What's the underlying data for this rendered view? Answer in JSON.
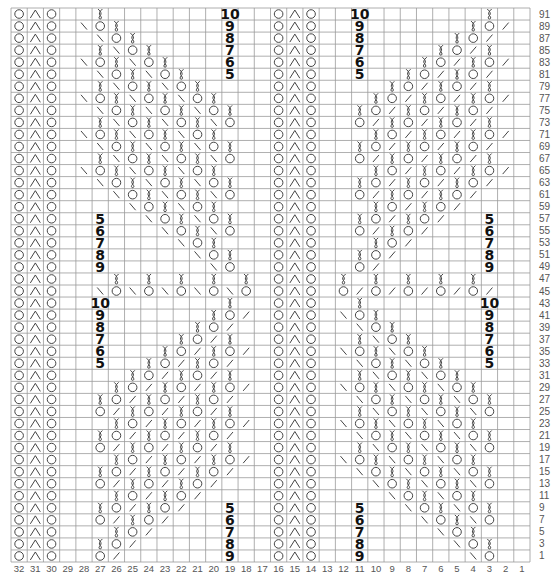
{
  "chart": {
    "type": "knitting-chart",
    "columns": 32,
    "rows_shown": 46,
    "row_numbers": [
      91,
      89,
      87,
      85,
      83,
      81,
      79,
      77,
      75,
      73,
      71,
      69,
      67,
      65,
      63,
      61,
      59,
      57,
      55,
      53,
      51,
      49,
      47,
      45,
      43,
      41,
      39,
      37,
      35,
      33,
      31,
      29,
      27,
      25,
      23,
      21,
      19,
      17,
      15,
      13,
      11,
      9,
      7,
      5,
      3,
      1
    ],
    "column_numbers": [
      32,
      31,
      30,
      29,
      28,
      27,
      26,
      25,
      24,
      23,
      22,
      21,
      20,
      19,
      18,
      17,
      16,
      15,
      14,
      13,
      12,
      11,
      10,
      9,
      8,
      7,
      6,
      5,
      4,
      3,
      2,
      1
    ],
    "legend_codes": {
      ".": "empty",
      "O": "yarn-over",
      "A": "central-double-decrease",
      "T": "twisted-stitch",
      "B": "left-slant-decrease",
      "F": "right-slant-decrease"
    },
    "colors": {
      "grid_line": "#9a9a9a",
      "symbol": "#444444",
      "label": "#111111",
      "axis_text": "#555555"
    },
    "rows": [
      {
        "row": 91,
        "left": "..T..........",
        "right": "..........T..",
        "labels": [
          {
            "col": 19,
            "text": "10"
          },
          {
            "col": 11,
            "text": "10"
          }
        ]
      },
      {
        "row": 89,
        "left": ".BOT.........",
        "right": ".........TOF.",
        "labels": [
          {
            "col": 19,
            "text": "9"
          },
          {
            "col": 11,
            "text": "9"
          }
        ]
      },
      {
        "row": 87,
        "left": "..BOT........",
        "right": "........TOF..",
        "labels": [
          {
            "col": 19,
            "text": "8"
          },
          {
            "col": 11,
            "text": "8"
          }
        ]
      },
      {
        "row": 85,
        "left": "..TBOT.......",
        "right": ".......TOFT..",
        "labels": [
          {
            "col": 19,
            "text": "7"
          },
          {
            "col": 11,
            "text": "7"
          }
        ]
      },
      {
        "row": 83,
        "left": ".BOTBOT......",
        "right": "......TOFTOF.",
        "labels": [
          {
            "col": 19,
            "text": "6"
          },
          {
            "col": 11,
            "text": "6"
          }
        ]
      },
      {
        "row": 81,
        "left": "..BOTBOT.....",
        "right": ".....TOFTOF..",
        "labels": [
          {
            "col": 19,
            "text": "5"
          },
          {
            "col": 11,
            "text": "5"
          }
        ]
      },
      {
        "row": 79,
        "left": "..TBOTBOT....",
        "right": "....TOFTOFT..",
        "labels": []
      },
      {
        "row": 77,
        "left": ".BOTBOTBOT...",
        "right": "...TOFTOFTOF.",
        "labels": []
      },
      {
        "row": 75,
        "left": "..BOTBOTBOT..",
        "right": "..TOFTOFTOF..",
        "labels": []
      },
      {
        "row": 73,
        "left": "..TBOTBOTBO..",
        "right": "..OFTOFTOFT..",
        "labels": []
      },
      {
        "row": 71,
        "left": ".BOTBOTBOT...",
        "right": "...TOFTOFTOF.",
        "labels": []
      },
      {
        "row": 69,
        "left": "..BOTBOTBOT..",
        "right": "..TOFTOFTOF..",
        "labels": []
      },
      {
        "row": 67,
        "left": "..TBOTBOTBO..",
        "right": "..OFTOFTOFT..",
        "labels": []
      },
      {
        "row": 65,
        "left": ".BOTBOTBOT...",
        "right": "...TOFTOFTOF.",
        "labels": []
      },
      {
        "row": 63,
        "left": "..BOTBOTBOT..",
        "right": "..TOFTOFTOF..",
        "labels": []
      },
      {
        "row": 61,
        "left": "...BOTBOTBO..",
        "right": "..OFTOFTOF...",
        "labels": []
      },
      {
        "row": 59,
        "left": "....BOTBOT...",
        "right": "...TOFTOF....",
        "labels": []
      },
      {
        "row": 57,
        "left": ".....BOTBOT..",
        "right": "..TOFTOF.....",
        "labels": [
          {
            "col": 27,
            "text": "5"
          },
          {
            "col": 3,
            "text": "5"
          }
        ]
      },
      {
        "row": 55,
        "left": "......BOTBO..",
        "right": "..OFTOF......",
        "labels": [
          {
            "col": 27,
            "text": "6"
          },
          {
            "col": 3,
            "text": "6"
          }
        ]
      },
      {
        "row": 53,
        "left": ".......BOT...",
        "right": "...TOF.......",
        "labels": [
          {
            "col": 27,
            "text": "7"
          },
          {
            "col": 3,
            "text": "7"
          }
        ]
      },
      {
        "row": 51,
        "left": "........BOT..",
        "right": "..TOF........",
        "labels": [
          {
            "col": 27,
            "text": "8"
          },
          {
            "col": 3,
            "text": "8"
          }
        ]
      },
      {
        "row": 49,
        "left": ".........BO..",
        "right": "..OF.........",
        "labels": [
          {
            "col": 27,
            "text": "9"
          },
          {
            "col": 3,
            "text": "9"
          }
        ]
      },
      {
        "row": 47,
        "left": "...T.T.T.T.T.",
        "right": ".T.T.T.T.T...",
        "labels": []
      },
      {
        "row": 45,
        "left": "..BOBOBOBOBO.",
        "right": ".OFOFOFOFOF..",
        "labels": []
      },
      {
        "row": 43,
        "left": "..........T..",
        "right": "..T..........",
        "labels": [
          {
            "col": 27,
            "text": "10"
          },
          {
            "col": 3,
            "text": "10"
          }
        ]
      },
      {
        "row": 41,
        "left": ".........TOF.",
        "right": ".BOT.........",
        "labels": [
          {
            "col": 27,
            "text": "9"
          },
          {
            "col": 3,
            "text": "9"
          }
        ]
      },
      {
        "row": 39,
        "left": "........TOF..",
        "right": "..BOT........",
        "labels": [
          {
            "col": 27,
            "text": "8"
          },
          {
            "col": 3,
            "text": "8"
          }
        ]
      },
      {
        "row": 37,
        "left": ".......TOFT..",
        "right": "..TBOT.......",
        "labels": [
          {
            "col": 27,
            "text": "7"
          },
          {
            "col": 3,
            "text": "7"
          }
        ]
      },
      {
        "row": 35,
        "left": "......TOFTOF.",
        "right": ".BOTBOT......",
        "labels": [
          {
            "col": 27,
            "text": "6"
          },
          {
            "col": 3,
            "text": "6"
          }
        ]
      },
      {
        "row": 33,
        "left": ".....TOFTOF..",
        "right": "..BOTBOT.....",
        "labels": [
          {
            "col": 27,
            "text": "5"
          },
          {
            "col": 3,
            "text": "5"
          }
        ]
      },
      {
        "row": 31,
        "left": "....TOFTOFT..",
        "right": "..TBOTBOT....",
        "labels": []
      },
      {
        "row": 29,
        "left": "...TOFTOFTOF.",
        "right": ".BOTBOTBOT...",
        "labels": []
      },
      {
        "row": 27,
        "left": "..TOFTOFTOF..",
        "right": "..BOTBOTBOT..",
        "labels": []
      },
      {
        "row": 25,
        "left": "..OFTOFTOFT..",
        "right": "..TBOTBOTBO..",
        "labels": []
      },
      {
        "row": 23,
        "left": "...TOFTOFTOF.",
        "right": ".BOTBOTBOT...",
        "labels": []
      },
      {
        "row": 21,
        "left": "..TOFTOFTOF..",
        "right": "..BOTBOTBOT..",
        "labels": []
      },
      {
        "row": 19,
        "left": "..OFTOFTOFT..",
        "right": "..TBOTBOTBO..",
        "labels": []
      },
      {
        "row": 17,
        "left": "...TOFTOFTOF.",
        "right": ".BOTBOTBOT...",
        "labels": []
      },
      {
        "row": 15,
        "left": "..TOFTOFTOF..",
        "right": "..BOTBOTBOT..",
        "labels": []
      },
      {
        "row": 13,
        "left": "..OFTOFTOF...",
        "right": "...BOTBOTBO..",
        "labels": []
      },
      {
        "row": 11,
        "left": "...TOFTOF....",
        "right": "....BOTBOT...",
        "labels": []
      },
      {
        "row": 9,
        "left": "..TOFTOF.....",
        "right": ".....BOTBOT..",
        "labels": [
          {
            "col": 19,
            "text": "5"
          },
          {
            "col": 11,
            "text": "5"
          }
        ]
      },
      {
        "row": 7,
        "left": "..OFTOF......",
        "right": "......BOTBO..",
        "labels": [
          {
            "col": 19,
            "text": "6"
          },
          {
            "col": 11,
            "text": "6"
          }
        ]
      },
      {
        "row": 5,
        "left": "...TOF.......",
        "right": ".......BOT...",
        "labels": [
          {
            "col": 19,
            "text": "7"
          },
          {
            "col": 11,
            "text": "7"
          }
        ]
      },
      {
        "row": 3,
        "left": "..TOF........",
        "right": "........BOT..",
        "labels": [
          {
            "col": 19,
            "text": "8"
          },
          {
            "col": 11,
            "text": "8"
          }
        ]
      },
      {
        "row": 1,
        "left": "..OF.........",
        "right": ".........BO..",
        "labels": [
          {
            "col": 19,
            "text": "9"
          },
          {
            "col": 11,
            "text": "9"
          }
        ]
      }
    ],
    "fixed_columns": {
      "left_border": {
        "cols": [
          32,
          31,
          30
        ],
        "symbols": "OAO"
      },
      "center_border": {
        "cols": [
          16,
          15,
          14
        ],
        "symbols": "OAO"
      }
    }
  }
}
